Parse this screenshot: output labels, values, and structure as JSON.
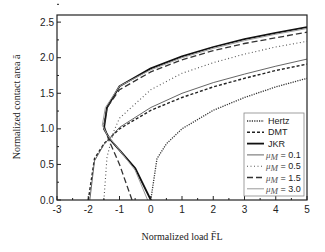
{
  "chart_data": {
    "type": "line",
    "title": "",
    "xlabel": "Normalized load F̄L",
    "ylabel": "Normalized contact area ā",
    "xlim": [
      -3,
      5
    ],
    "ylim": [
      0,
      2.6
    ],
    "xticks": [
      "-3",
      "-2",
      "-1",
      "0",
      "1",
      "2",
      "3",
      "4",
      "5"
    ],
    "yticks": [
      "0.0",
      "0.5",
      "1.0",
      "1.5",
      "2.0",
      "2.5"
    ],
    "grid": false,
    "legend_position": "lower right",
    "legend": [
      "Hertz",
      "DMT",
      "JKR",
      "μM = 0.1",
      "μM = 0.5",
      "μM = 1.5",
      "μM = 3.0"
    ],
    "series": [
      {
        "name": "Hertz",
        "style": "dotted-dense",
        "x": [
          0,
          0.2,
          0.5,
          1,
          2,
          3,
          4,
          5
        ],
        "y": [
          0,
          0.58,
          0.79,
          1.0,
          1.26,
          1.44,
          1.59,
          1.71
        ]
      },
      {
        "name": "DMT",
        "style": "dashed-short",
        "x": [
          -2,
          -1.8,
          -1.5,
          -1,
          0,
          1,
          2,
          3,
          4,
          5
        ],
        "y": [
          0,
          0.58,
          0.79,
          1.0,
          1.26,
          1.44,
          1.59,
          1.71,
          1.82,
          1.91
        ]
      },
      {
        "name": "JKR",
        "style": "solid-thick",
        "x": [
          0,
          -0.5,
          -1,
          -1.3,
          -1.5,
          -1.4,
          -1,
          0,
          1,
          2,
          3,
          4,
          5
        ],
        "y": [
          0,
          0.45,
          0.7,
          0.85,
          1.0,
          1.3,
          1.6,
          1.85,
          2.02,
          2.15,
          2.26,
          2.35,
          2.43
        ]
      },
      {
        "name": "μM = 0.1",
        "style": "solid-thin",
        "x": [
          -1.95,
          -1.8,
          -1.5,
          -1,
          0,
          1,
          2,
          3,
          4,
          5
        ],
        "y": [
          0,
          0.55,
          0.78,
          1.02,
          1.3,
          1.5,
          1.65,
          1.77,
          1.88,
          1.98
        ]
      },
      {
        "name": "μM = 0.5",
        "style": "dotted-sparse",
        "x": [
          -1.5,
          -1.4,
          -1.2,
          -1,
          0,
          1,
          2,
          3,
          4,
          5
        ],
        "y": [
          0,
          0.6,
          0.95,
          1.15,
          1.55,
          1.78,
          1.93,
          2.05,
          2.15,
          2.23
        ]
      },
      {
        "name": "μM = 1.5",
        "style": "dashed-long",
        "x": [
          -0.6,
          -1,
          -1.35,
          -1.5,
          -1.4,
          -1,
          0,
          1,
          2,
          3,
          4,
          5
        ],
        "y": [
          0,
          0.5,
          0.85,
          1.05,
          1.3,
          1.55,
          1.8,
          1.97,
          2.1,
          2.2,
          2.28,
          2.36
        ]
      },
      {
        "name": "μM = 3.0",
        "style": "solid-gray",
        "x": [
          -0.1,
          -0.5,
          -1,
          -1.4,
          -1.55,
          -1.45,
          -1,
          0,
          1,
          2,
          3,
          4,
          5
        ],
        "y": [
          0,
          0.42,
          0.7,
          0.92,
          1.05,
          1.3,
          1.6,
          1.83,
          2.0,
          2.13,
          2.24,
          2.33,
          2.41
        ]
      }
    ]
  }
}
